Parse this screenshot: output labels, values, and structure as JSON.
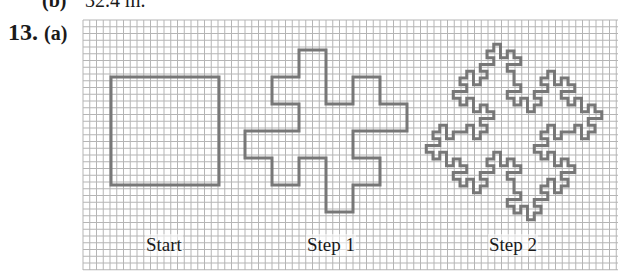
{
  "previous_answer": {
    "label": "(b)",
    "value": "32.4 m."
  },
  "problem": {
    "number": "13.",
    "part": "(a)"
  },
  "figure": {
    "grid": {
      "x": 83,
      "y": 20,
      "width": 535,
      "height": 250,
      "cell": 6.75,
      "line_color": "#b5b5b5"
    },
    "stroke_color": "#777777",
    "stroke_width": 3,
    "shapes": [
      {
        "name": "start",
        "label": "Start",
        "level": 0,
        "square": [
          111,
          77,
          108
        ],
        "label_x": 145
      },
      {
        "name": "step-1",
        "label": "Step 1",
        "level": 1,
        "square": [
          272,
          77,
          108
        ],
        "label_x": 306
      },
      {
        "name": "step-2",
        "label": "Step 2",
        "level": 2,
        "square": [
          460,
          78,
          108
        ],
        "label_x": 488
      }
    ],
    "generator_turns": [
      0,
      90,
      0,
      -90,
      -90,
      0,
      90,
      0
    ]
  }
}
